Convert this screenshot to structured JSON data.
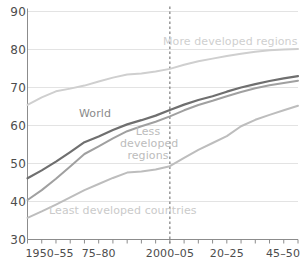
{
  "chart_data": {
    "type": "line",
    "title": "",
    "subtitle": "",
    "xlabel": "",
    "ylabel": "",
    "xlim": [
      0,
      19
    ],
    "ylim": [
      30,
      90
    ],
    "grid": true,
    "legend_position": "inline-annotations",
    "x": [
      "1950-55",
      "1955-60",
      "1960-65",
      "1965-70",
      "1970-75",
      "1975-80",
      "1980-85",
      "1985-90",
      "1990-95",
      "1995-2000",
      "2000-05",
      "2005-10",
      "2010-15",
      "2015-20",
      "2020-25",
      "2025-30",
      "2030-35",
      "2035-40",
      "2040-45",
      "2045-50"
    ],
    "x_tick_labels": [
      "1950–55",
      "75–80",
      "2000–05",
      "20–25",
      "45–50"
    ],
    "x_tick_label_indices": [
      0,
      5,
      10,
      14,
      19
    ],
    "y_ticks": [
      30,
      40,
      50,
      60,
      70,
      80,
      90
    ],
    "y_tick_labels": [
      "30",
      "40",
      "50",
      "60",
      "70",
      "80",
      "90"
    ],
    "reference_line": {
      "x_index": 10,
      "label": "2000-05",
      "style": "dashed"
    },
    "series": [
      {
        "name": "More developed regions",
        "color": "#cfcfcf",
        "label_position": "above-line-right",
        "values": [
          65.4,
          67.4,
          69.0,
          69.7,
          70.5,
          71.6,
          72.6,
          73.4,
          73.7,
          74.2,
          74.9,
          76.0,
          76.9,
          77.6,
          78.3,
          78.9,
          79.4,
          79.8,
          80.0,
          80.1
        ]
      },
      {
        "name": "World",
        "color": "#6f6f6f",
        "label_position": "above-line-left",
        "values": [
          46.1,
          48.2,
          50.5,
          53.0,
          55.6,
          57.1,
          58.8,
          60.3,
          61.4,
          62.6,
          64.1,
          65.5,
          66.7,
          67.7,
          68.9,
          70.0,
          70.9,
          71.7,
          72.4,
          73.0
        ]
      },
      {
        "name": "Less developed regions",
        "color": "#a0a0a0",
        "label_position": "right-of-reference",
        "values": [
          40.4,
          43.0,
          46.0,
          49.2,
          52.5,
          54.5,
          56.6,
          58.5,
          59.8,
          61.0,
          62.4,
          64.0,
          65.4,
          66.5,
          67.7,
          68.8,
          69.8,
          70.6,
          71.2,
          71.8
        ]
      },
      {
        "name": "Least developed countries",
        "color": "#bdbdbd",
        "label_position": "above-line-bottom",
        "values": [
          35.7,
          37.4,
          39.2,
          41.1,
          43.0,
          44.6,
          46.2,
          47.6,
          47.9,
          48.4,
          49.3,
          51.5,
          53.6,
          55.4,
          57.2,
          59.8,
          61.5,
          62.8,
          64.0,
          65.2
        ]
      }
    ],
    "annotations": [
      {
        "text": "More developed regions",
        "series": "More developed regions",
        "color": "#cfcfcf"
      },
      {
        "text": "World",
        "series": "World",
        "color": "#8a8a8a"
      },
      {
        "text": "Less developed regions",
        "series": "Less developed regions",
        "color": "#bcbcbc"
      },
      {
        "text": "Least developed countries",
        "series": "Least developed countries",
        "color": "#cacaca"
      }
    ]
  },
  "axis": {
    "axis_color": "#8c8c8c",
    "grid_color": "#e3e3e3",
    "tick_color": "#8c8c8c",
    "label_color": "#4d4d4d"
  }
}
